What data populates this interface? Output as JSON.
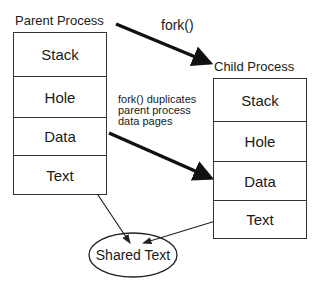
{
  "diagram": {
    "parent": {
      "title": "Parent Process",
      "segments": [
        "Stack",
        "Hole",
        "Data",
        "Text"
      ]
    },
    "child": {
      "title": "Child Process",
      "segments": [
        "Stack",
        "Hole",
        "Data",
        "Text"
      ]
    },
    "fork_label": "fork()",
    "note_lines": [
      "fork() duplicates",
      "parent process",
      "data pages"
    ],
    "shared": "Shared Text"
  }
}
